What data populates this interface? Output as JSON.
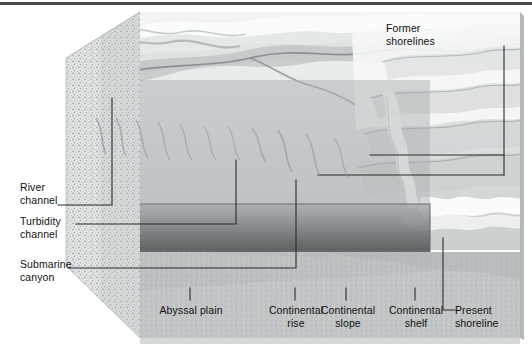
{
  "figure": {
    "type": "geological-block-diagram",
    "palette": {
      "rule": "#4a4a4a",
      "leader_line": "#2b2b2b",
      "water_body": "#9aa0a2",
      "water_body_top": "#a8aeb0",
      "abyssal_floor": "#b9bcbd",
      "stipple_face": "#cfd2d3",
      "relief_light": "#f2f3f3",
      "relief_mid": "#c6cacb",
      "relief_dark": "#8f9597",
      "label_text": "#111111"
    }
  },
  "labels": {
    "river_channel": "River\nchannel",
    "turbidity_channel": "Turbidity\nchannel",
    "submarine_canyon": "Submarine\ncanyon",
    "former_shorelines": "Former\nshorelines",
    "abyssal_plain": "Abyssal plain",
    "continental_rise": "Continental\nrise",
    "continental_slope": "Continental\nslope",
    "continental_shelf": "Continental\nshelf",
    "present_shoreline": "Present\nshoreline"
  },
  "leaders": {
    "river_channel": "horizontal at y=205 from x=58 to x=112, vertical up to y=98",
    "turbidity_channel": "horizontal at y=224 from x=76 to x=236, vertical up to y=160",
    "submarine_canyon": "horizontal at y=268 from x=68 to x=296, vertical up to y=180",
    "former_shorelines": "vertical at x=504 from y=46 down to y=175, with branches left at y=155 to x=370 and y=175 to x=318",
    "abyssal_plain": "tick at x=190 from y=288 to y=300",
    "continental_rise": "tick at x=295 from y=288 to y=300",
    "continental_slope": "tick at x=346 from y=288 to y=300",
    "continental_shelf": "tick at x=415 from y=288 to y=300",
    "present_shoreline": "vertical at x=443 from y=238 to y=310, horizontal right to x=455"
  }
}
